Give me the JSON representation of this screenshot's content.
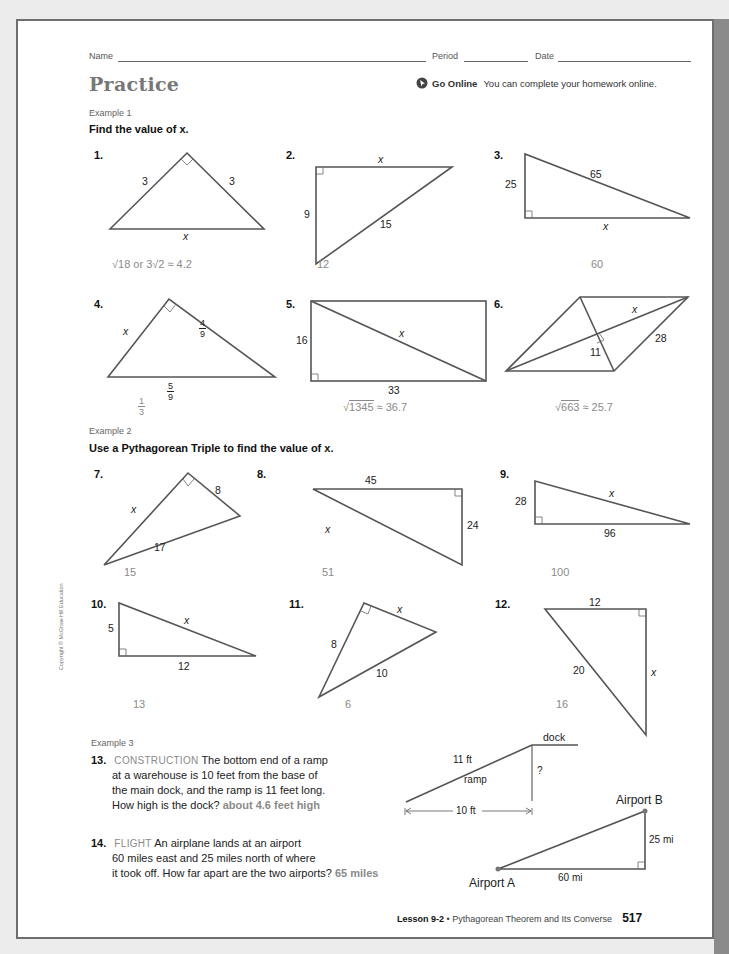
{
  "header": {
    "name_label": "Name",
    "period_label": "Period",
    "date_label": "Date",
    "title": "Practice",
    "go_online_label": "Go Online",
    "go_online_text": "You can complete your homework online."
  },
  "example1": {
    "label": "Example 1",
    "instruction": "Find the value of x."
  },
  "example2": {
    "label": "Example 2",
    "instruction": "Use a Pythagorean Triple to find the value of x."
  },
  "example3": {
    "label": "Example 3"
  },
  "problems": [
    {
      "num": "1.",
      "labels": [
        "3",
        "3",
        "x"
      ],
      "answer": "√18 or 3√2 ≈ 4.2"
    },
    {
      "num": "2.",
      "labels": [
        "x",
        "9",
        "15"
      ],
      "answer": "12"
    },
    {
      "num": "3.",
      "labels": [
        "25",
        "65",
        "x"
      ],
      "answer": "60"
    },
    {
      "num": "4.",
      "labels": [
        "x",
        "4",
        "9",
        "5",
        "9"
      ],
      "answer_num": "1",
      "answer_den": "3"
    },
    {
      "num": "5.",
      "labels": [
        "16",
        "x",
        "33"
      ],
      "answer_rad": "1345",
      "answer_rest": " ≈ 36.7"
    },
    {
      "num": "6.",
      "labels": [
        "x",
        "28",
        "11"
      ],
      "answer_rad": "663",
      "answer_rest": " ≈ 25.7"
    },
    {
      "num": "7.",
      "labels": [
        "x",
        "8",
        "17"
      ],
      "answer": "15"
    },
    {
      "num": "8.",
      "labels": [
        "45",
        "x",
        "24"
      ],
      "answer": "51"
    },
    {
      "num": "9.",
      "labels": [
        "28",
        "x",
        "96"
      ],
      "answer": "100"
    },
    {
      "num": "10.",
      "labels": [
        "5",
        "x",
        "12"
      ],
      "answer": "13"
    },
    {
      "num": "11.",
      "labels": [
        "8",
        "x",
        "10"
      ],
      "answer": "6"
    },
    {
      "num": "12.",
      "labels": [
        "12",
        "20",
        "x"
      ],
      "answer": "16"
    },
    {
      "num": "13.",
      "caption": "CONSTRUCTION",
      "lines": [
        "The bottom end of a ramp",
        "at a warehouse is 10 feet from the base of",
        "the main dock, and the ramp is 11 feet long.",
        "How high is the dock?"
      ],
      "answer": "about 4.6 feet high",
      "figure": {
        "dock": "dock",
        "length": "11 ft",
        "ramp": "ramp",
        "unknown": "?",
        "base": "10 ft"
      }
    },
    {
      "num": "14.",
      "caption": "FLIGHT",
      "lines": [
        "An airplane lands at an airport",
        "60 miles east and 25 miles north of where",
        "it took off. How far apart are the two airports?"
      ],
      "answer": "65 miles",
      "figure": {
        "point_b": "Airport B",
        "point_a": "Airport A",
        "vertical": "25 mi",
        "horizontal": "60 mi"
      }
    }
  ],
  "copyright": "Copyright © McGraw-Hill Education",
  "footer": {
    "lesson": "Lesson 9-2",
    "separator": " • ",
    "title": "Pythagorean Theorem and Its Converse",
    "page": "517"
  }
}
